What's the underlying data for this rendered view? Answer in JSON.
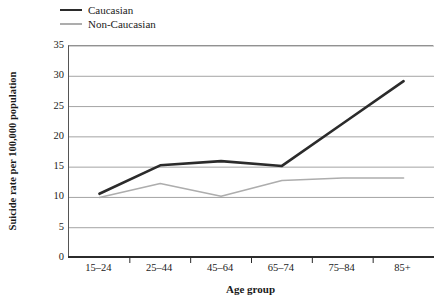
{
  "chart_data": {
    "type": "line",
    "title": "",
    "xlabel": "Age group",
    "ylabel": "Suicide rate per 100,000 population",
    "categories": [
      "15–24",
      "25–44",
      "45–64",
      "65–74",
      "75–84",
      "85+"
    ],
    "series": [
      {
        "name": "Caucasian",
        "values": [
          10.6,
          15.3,
          16.0,
          15.2,
          22.2,
          29.2
        ],
        "color": "#2b2b2b",
        "line_width": 2.6
      },
      {
        "name": "Non-Caucasian",
        "values": [
          10.0,
          12.3,
          10.2,
          12.8,
          13.2,
          13.2
        ],
        "color": "#adadad",
        "line_width": 1.6
      }
    ],
    "ylim": [
      0,
      35
    ],
    "yticks": [
      0,
      5,
      10,
      15,
      20,
      25,
      30,
      35
    ],
    "ytick_labels": [
      "0",
      "5",
      "10",
      "15",
      "20",
      "25",
      "30",
      "35"
    ],
    "grid": true,
    "grid_axis": "y",
    "grid_color": "#9a9a9a",
    "legend_position": "top-left",
    "legend_entries": [
      "Caucasian",
      "Non-Caucasian"
    ]
  }
}
